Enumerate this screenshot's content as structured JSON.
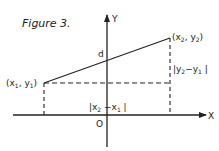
{
  "figure": {
    "title": "Figure 3.",
    "axes": {
      "x_label": "X",
      "y_label": "Y",
      "origin_label": "O"
    },
    "points": {
      "p1": {
        "label": "(x1, y1)",
        "name": "x",
        "sub": "1",
        "name2": "y",
        "sub2": "1"
      },
      "p2": {
        "label": "(x2, y2)",
        "name": "x",
        "sub": "2",
        "name2": "y",
        "sub2": "2"
      }
    },
    "intercept_label": "d",
    "horizontal_distance": {
      "label": "|x2 - x1|"
    },
    "vertical_distance": {
      "label": "|y2 - y1|"
    },
    "colors": {
      "ink": "#222222",
      "background": "#ffffff"
    }
  }
}
